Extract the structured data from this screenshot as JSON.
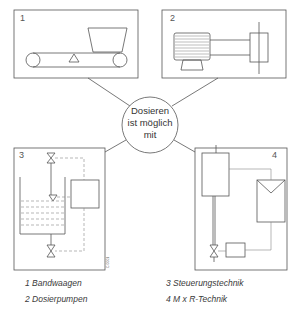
{
  "center": {
    "line1": "Dosieren",
    "line2": "ist möglich",
    "line3": "mit"
  },
  "panels": [
    {
      "number": "1",
      "subject": "belt weigher (conveyor with hopper)"
    },
    {
      "number": "2",
      "subject": "dosing pump (motor with pump head)"
    },
    {
      "number": "3",
      "subject": "control technology (tank with valves and controller)"
    },
    {
      "number": "4",
      "subject": "M x R technology (vessel, instrument, valve, controller)"
    }
  ],
  "legend": {
    "items": [
      {
        "label": "1 Bandwaagen"
      },
      {
        "label": "2 Dosierpumpen"
      },
      {
        "label": "3 Steuerungstechnik"
      },
      {
        "label": "4 M x R-Technik"
      }
    ]
  },
  "figure_code": "C 0001",
  "colors": {
    "line": "#555555",
    "dashed": "#888888",
    "background": "#ffffff"
  }
}
